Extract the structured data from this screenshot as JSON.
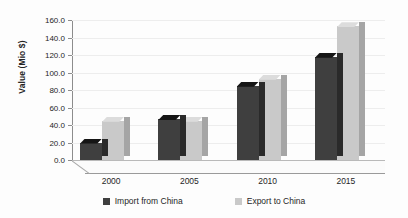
{
  "chart_data": {
    "type": "bar",
    "title": "",
    "subtitle": "",
    "xlabel": "",
    "ylabel": "Value (Mio $)",
    "categories": [
      "2000",
      "2005",
      "2010",
      "2015"
    ],
    "series": [
      {
        "name": "Import from China",
        "color": "#3f3f3f",
        "values": [
          20.0,
          47.0,
          85.0,
          118.0
        ]
      },
      {
        "name": "Export to China",
        "color": "#c9c9c9",
        "values": [
          45.0,
          45.0,
          93.0,
          153.0
        ]
      }
    ],
    "ylim": [
      0.0,
      160.0
    ],
    "ytick_step": 20.0,
    "yticks": [
      "0.0",
      "20.0",
      "40.0",
      "60.0",
      "80.0",
      "100.0",
      "120.0",
      "140.0",
      "160.0"
    ],
    "grid": true,
    "legend_position": "bottom",
    "three_d": true
  },
  "legend": {
    "items": [
      {
        "label": "Import from China",
        "color": "#3f3f3f"
      },
      {
        "label": "Export to China",
        "color": "#c9c9c9"
      }
    ]
  },
  "axis": {
    "y_title": "Value (Mio $)"
  }
}
